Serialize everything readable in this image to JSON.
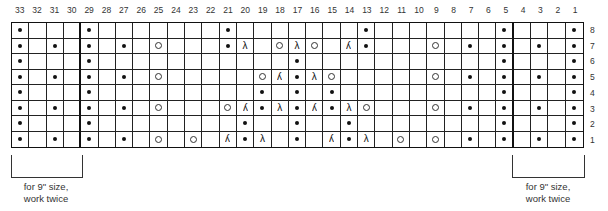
{
  "chart": {
    "column_numbers": [
      "33",
      "32",
      "31",
      "30",
      "29",
      "28",
      "27",
      "26",
      "25",
      "24",
      "23",
      "22",
      "21",
      "20",
      "19",
      "18",
      "17",
      "16",
      "15",
      "14",
      "13",
      "12",
      "11",
      "10",
      "9",
      "8",
      "7",
      "6",
      "5",
      "4",
      "3",
      "2",
      "1"
    ],
    "row_numbers": [
      "8",
      "7",
      "6",
      "5",
      "4",
      "3",
      "2",
      "1"
    ],
    "thick_dividers_after_columns": [
      "30",
      "5"
    ],
    "symbols": {
      "dot": "purl",
      "yo": "yarn-over",
      "k2tog": "λ",
      "ssk": "λ"
    },
    "rows": [
      {
        "row": "8",
        "cells": {
          "33": "dot",
          "29": "dot",
          "21": "dot",
          "13": "dot",
          "5": "dot",
          "1": "dot"
        }
      },
      {
        "row": "7",
        "cells": {
          "33": "dot",
          "31": "dot",
          "29": "dot",
          "27": "dot",
          "25": "yo",
          "21": "dot",
          "20": "k2tog",
          "18": "yo",
          "17": "k2tog",
          "16": "yo",
          "14": "ssk",
          "13": "dot",
          "9": "yo",
          "7": "dot",
          "5": "dot",
          "3": "dot",
          "1": "dot"
        }
      },
      {
        "row": "6",
        "cells": {
          "33": "dot",
          "29": "dot",
          "17": "dot",
          "5": "dot",
          "1": "dot"
        }
      },
      {
        "row": "5",
        "cells": {
          "33": "dot",
          "31": "dot",
          "29": "dot",
          "27": "dot",
          "25": "yo",
          "19": "yo",
          "18": "ssk",
          "17": "dot",
          "16": "k2tog",
          "15": "yo",
          "9": "yo",
          "7": "dot",
          "5": "dot",
          "3": "dot",
          "1": "dot"
        }
      },
      {
        "row": "4",
        "cells": {
          "33": "dot",
          "29": "dot",
          "19": "dot",
          "17": "dot",
          "15": "dot",
          "5": "dot",
          "1": "dot"
        }
      },
      {
        "row": "3",
        "cells": {
          "33": "dot",
          "31": "dot",
          "29": "dot",
          "27": "dot",
          "25": "yo",
          "21": "yo",
          "20": "ssk",
          "19": "dot",
          "18": "k2tog",
          "17": "dot",
          "16": "ssk",
          "15": "dot",
          "14": "k2tog",
          "13": "yo",
          "9": "yo",
          "7": "dot",
          "5": "dot",
          "3": "dot",
          "1": "dot"
        }
      },
      {
        "row": "2",
        "cells": {
          "33": "dot",
          "29": "dot",
          "20": "dot",
          "17": "dot",
          "14": "dot",
          "5": "dot",
          "1": "dot"
        }
      },
      {
        "row": "1",
        "cells": {
          "33": "dot",
          "31": "dot",
          "29": "dot",
          "27": "dot",
          "25": "yo",
          "23": "yo",
          "21": "ssk",
          "20": "dot",
          "19": "k2tog",
          "17": "dot",
          "15": "ssk",
          "14": "dot",
          "13": "k2tog",
          "11": "yo",
          "9": "yo",
          "7": "dot",
          "5": "dot",
          "3": "dot",
          "1": "dot"
        }
      }
    ]
  },
  "notes": {
    "left": {
      "line1": "for 9\" size,",
      "line2": "work twice"
    },
    "right": {
      "line1": "for 9\" size,",
      "line2": "work twice"
    }
  }
}
